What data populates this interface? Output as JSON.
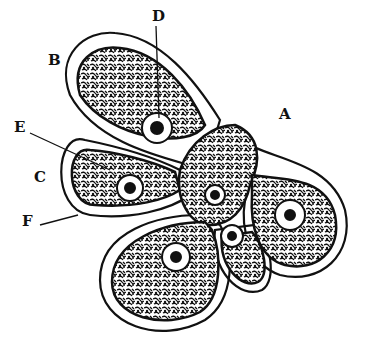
{
  "figure": {
    "labels": [
      {
        "id": "A",
        "text": "A",
        "x": 279,
        "y": 107
      },
      {
        "id": "B",
        "text": "B",
        "x": 48,
        "y": 53
      },
      {
        "id": "C",
        "text": "C",
        "x": 34,
        "y": 170
      },
      {
        "id": "D",
        "text": "D",
        "x": 152,
        "y": 9
      },
      {
        "id": "E",
        "text": "E",
        "x": 14,
        "y": 120
      },
      {
        "id": "F",
        "text": "F",
        "x": 22,
        "y": 214
      }
    ],
    "colors": {
      "ink": "#111111",
      "background": "#ffffff"
    }
  }
}
